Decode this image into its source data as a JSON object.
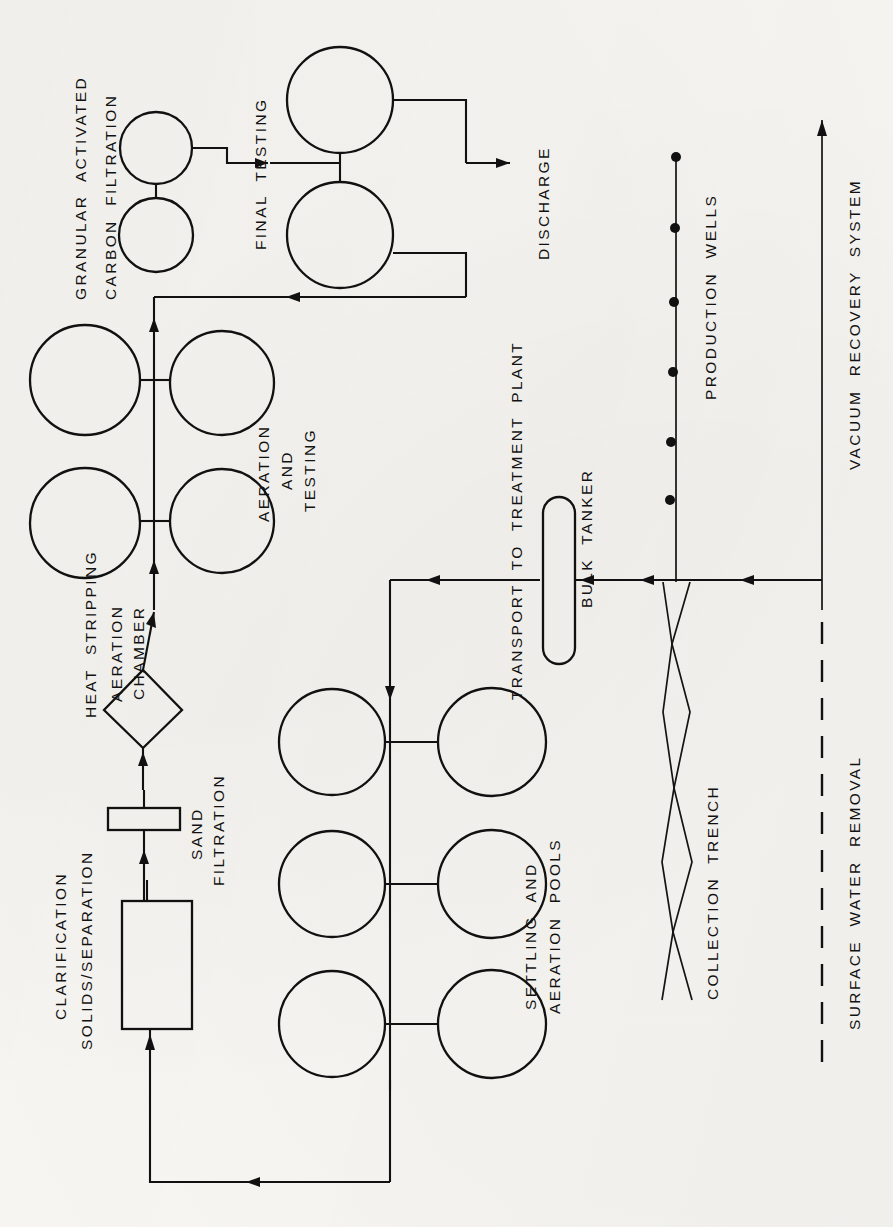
{
  "document": {
    "type": "process-flow-diagram",
    "title": "Groundwater Treatment Process Flow Diagram",
    "orientation": "rotated-90-ccw",
    "page_width": 893,
    "page_height": 1227,
    "background_color": "#f7f6f2",
    "ink_color": "#111111"
  },
  "labels": {
    "granular_activated": "GRANULAR  ACTIVATED",
    "carbon_filtration": "CARBON  FILTRATION",
    "final_testing": "FINAL  TESTING",
    "discharge": "DISCHARGE",
    "aeration_and": "AERATION",
    "and": "AND",
    "testing": "TESTING",
    "heat_stripping": "HEAT  STRIPPING",
    "aeration_chamber_1": "AERATION",
    "aeration_chamber_2": "CHAMBER",
    "sand": "SAND",
    "filtration": "FILTRATION",
    "clarification": "CLARIFICATION",
    "solids_separation": "SOLIDS/SEPARATION",
    "settling_and": "SETTLING  AND",
    "aeration_pools": "AERATION  POOLS",
    "transport_to_treatment_plant": "TRANSPORT  TO  TREATMENT  PLANT",
    "bulk_tanker": "BULK  TANKER",
    "production_wells": "PRODUCTION  WELLS",
    "collection_trench": "COLLECTION  TRENCH",
    "vacuum_recovery_system": "VACUUM  RECOVERY  SYSTEM",
    "surface_water_removal": "SURFACE  WATER  REMOVAL"
  },
  "process_stages": [
    {
      "id": "vacuum-recovery-system",
      "label": "VACUUM  RECOVERY  SYSTEM",
      "symbol": "long-arrow-line",
      "order": 1
    },
    {
      "id": "surface-water-removal",
      "label": "SURFACE  WATER  REMOVAL",
      "symbol": "dashed-line",
      "order": 1
    },
    {
      "id": "collection-trench",
      "label": "COLLECTION  TRENCH",
      "symbol": "crossing-zigzag-diamond-chain",
      "order": 2
    },
    {
      "id": "production-wells",
      "label": "PRODUCTION  WELLS",
      "symbol": "line-with-filled-dots",
      "well_count": 6,
      "order": 3
    },
    {
      "id": "bulk-tanker",
      "label": "BULK  TANKER",
      "symbol": "stadium-capsule",
      "order": 4
    },
    {
      "id": "transport-to-treatment-plant",
      "label": "TRANSPORT  TO  TREATMENT  PLANT",
      "symbol": "arrow",
      "order": 5
    },
    {
      "id": "settling-and-aeration-pools",
      "label": "SETTLING  AND  AERATION  POOLS",
      "symbol": "six-circles-paired",
      "pool_count": 6,
      "order": 6
    },
    {
      "id": "clarification-solids-separation",
      "label": "CLARIFICATION  SOLIDS/SEPARATION",
      "symbol": "rectangle",
      "order": 7
    },
    {
      "id": "sand-filtration",
      "label": "SAND  FILTRATION",
      "symbol": "thin-rectangle",
      "order": 8
    },
    {
      "id": "heat-stripping-aeration-chamber",
      "label": "HEAT  STRIPPING  AERATION  CHAMBER",
      "symbol": "diamond",
      "order": 9
    },
    {
      "id": "aeration-and-testing",
      "label": "AERATION  AND  TESTING",
      "symbol": "four-circles-paired",
      "tank_count": 4,
      "order": 10
    },
    {
      "id": "granular-activated-carbon-filtration",
      "label": "GRANULAR  ACTIVATED  CARBON  FILTRATION",
      "symbol": "two-circles-in-series",
      "vessel_count": 2,
      "order": 11
    },
    {
      "id": "final-testing",
      "label": "FINAL  TESTING",
      "symbol": "two-circles-paired",
      "vessel_count": 2,
      "order": 12
    },
    {
      "id": "discharge",
      "label": "DISCHARGE",
      "symbol": "arrow-out",
      "order": 13
    }
  ],
  "flows": [
    {
      "from": "vacuum-recovery-system",
      "to": "collection-trench",
      "style": "arrow"
    },
    {
      "from": "collection-trench",
      "to": "bulk-tanker",
      "style": "arrow"
    },
    {
      "from": "production-wells",
      "to": "bulk-tanker",
      "style": "arrow"
    },
    {
      "from": "bulk-tanker",
      "to": "settling-and-aeration-pools",
      "style": "arrow"
    },
    {
      "from": "settling-and-aeration-pools",
      "to": "clarification-solids-separation",
      "style": "recycle-arrow"
    },
    {
      "from": "clarification-solids-separation",
      "to": "sand-filtration",
      "style": "arrow"
    },
    {
      "from": "sand-filtration",
      "to": "heat-stripping-aeration-chamber",
      "style": "arrow"
    },
    {
      "from": "heat-stripping-aeration-chamber",
      "to": "aeration-and-testing",
      "style": "arrow"
    },
    {
      "from": "aeration-and-testing",
      "to": "granular-activated-carbon-filtration",
      "style": "arrow"
    },
    {
      "from": "granular-activated-carbon-filtration",
      "to": "final-testing",
      "style": "arrow"
    },
    {
      "from": "final-testing",
      "to": "discharge",
      "style": "arrow"
    },
    {
      "from": "final-testing",
      "to": "aeration-and-testing",
      "style": "return-arrow"
    }
  ]
}
